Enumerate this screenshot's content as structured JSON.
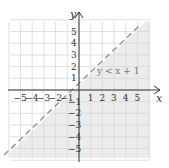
{
  "graph": {
    "x_label": "x",
    "y_label": "y",
    "x_ticks": [
      "−5",
      "−4",
      "−3",
      "−2",
      "−1",
      "1",
      "2",
      "3",
      "4",
      "5"
    ],
    "y_ticks": [
      "5",
      "4",
      "3",
      "2",
      "1",
      "−1",
      "−2",
      "−3",
      "−4",
      "−5"
    ],
    "inequality_label": "y < x + 1",
    "boundary": "dashed",
    "shaded_region": "below line",
    "colors": {
      "shade": "#ececec",
      "grid": "#d8d8d8",
      "line": "#999999",
      "axis": "#333333"
    }
  }
}
